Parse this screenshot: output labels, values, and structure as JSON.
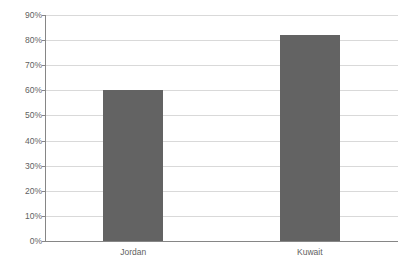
{
  "chart_data": {
    "type": "bar",
    "title": "",
    "subtitle": "",
    "xlabel": "",
    "ylabel": "",
    "categories": [
      "Jordan",
      "Kuwait"
    ],
    "values": [
      60,
      82
    ],
    "value_labels": [
      "60%",
      "82%"
    ],
    "ylim": [
      0,
      90
    ],
    "ytick_labels": [
      "0%",
      "10%",
      "20%",
      "30%",
      "40%",
      "50%",
      "60%",
      "70%",
      "80%",
      "90%"
    ],
    "ytick_values": [
      0,
      10,
      20,
      30,
      40,
      50,
      60,
      70,
      80,
      90
    ],
    "grid": true,
    "grid_axis": "y",
    "legend": false,
    "legend_position": "none",
    "series": [
      {
        "name": "",
        "values": [
          60,
          82
        ]
      }
    ],
    "colors": {
      "bar": "#636363",
      "gridline": "#d9d9d9",
      "axis": "#868686",
      "text": "#5f5f5f",
      "background": "#ffffff"
    }
  }
}
